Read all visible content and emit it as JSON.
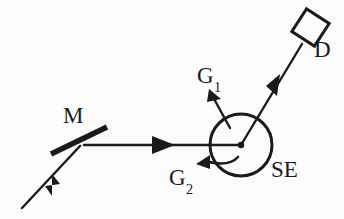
{
  "figure": {
    "kind": "optical-setup-schematic",
    "background_color": "#fbfbfb",
    "ink_color": "#1a1a1a",
    "width": 344,
    "height": 219,
    "labels": {
      "mirror": "M",
      "gradient_1_base": "G",
      "gradient_1_sub": "1",
      "gradient_2_base": "G",
      "gradient_2_sub": "2",
      "sample": "SE",
      "detector": "D"
    },
    "components": [
      {
        "name": "incoming-beam",
        "type": "arrow",
        "from": [
          22,
          208
        ],
        "to": [
          80,
          146
        ],
        "arrowhead_at": [
          52,
          178
        ]
      },
      {
        "name": "mirror",
        "type": "thick-segment",
        "from": [
          52,
          153
        ],
        "to": [
          106,
          128
        ],
        "stroke_width": 5
      },
      {
        "name": "horizontal-beam",
        "type": "arrow",
        "from": [
          84,
          145
        ],
        "to": [
          241,
          145
        ],
        "arrowhead_at": [
          164,
          145
        ]
      },
      {
        "name": "sample-circle",
        "type": "circle",
        "center": [
          241,
          145
        ],
        "radius": 31,
        "stroke_width": 3
      },
      {
        "name": "interaction-point",
        "type": "dot",
        "center": [
          241,
          145
        ],
        "radius": 3
      },
      {
        "name": "gradient-1-arrow",
        "type": "arrow",
        "from": [
          228,
          126
        ],
        "to": [
          210,
          92
        ]
      },
      {
        "name": "gradient-2-arrow",
        "type": "arrow",
        "from": [
          233,
          156
        ],
        "to": [
          198,
          163
        ]
      },
      {
        "name": "detector-beam",
        "type": "arrow",
        "from": [
          241,
          145
        ],
        "to": [
          303,
          43
        ],
        "arrowhead_at": [
          275,
          84
        ]
      },
      {
        "name": "detector-square",
        "type": "rotated-square",
        "center": [
          310,
          27
        ],
        "size": 27,
        "rotation_deg": 33,
        "stroke_width": 3
      }
    ]
  }
}
